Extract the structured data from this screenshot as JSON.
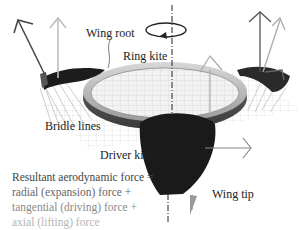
{
  "diagram": {
    "labels": {
      "wing_root": "Wing root",
      "ring_kite": "Ring kite",
      "bridle_lines": "Bridle lines",
      "driver_kite": "Driver kite",
      "wing_tip": "Wing tip"
    },
    "legend": {
      "line1": "Resultant aerodynamic force =",
      "line2": "radial (expansion) force +",
      "line3": "tangential (driving) force +",
      "line4": "axial (lifting) force"
    },
    "colors": {
      "resultant": "#444444",
      "radial": "#666666",
      "tangential": "#8a8a8a",
      "axial": "#b5b5b5",
      "ring": "#555555",
      "kite": "#1a1a1a"
    }
  }
}
